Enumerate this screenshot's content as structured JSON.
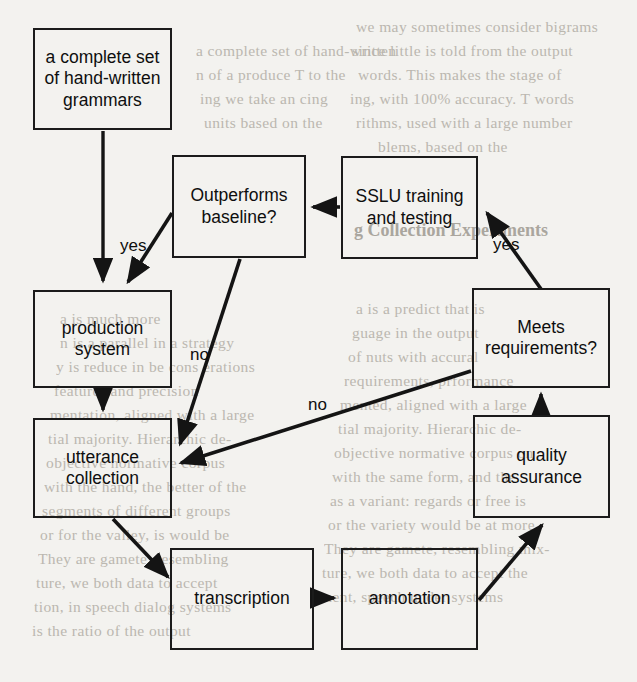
{
  "diagram": {
    "type": "flowchart",
    "nodes": [
      {
        "id": "grammars",
        "label": "a complete set\nof hand-written\ngrammars",
        "x": 33,
        "y": 28,
        "w": 139,
        "h": 102,
        "shape": "rect"
      },
      {
        "id": "outperforms",
        "label": "Outperforms\nbaseline?",
        "x": 172,
        "y": 155,
        "w": 134,
        "h": 103,
        "shape": "rect"
      },
      {
        "id": "sslu",
        "label": "SSLU training\nand testing",
        "x": 341,
        "y": 156,
        "w": 137,
        "h": 103,
        "shape": "rect"
      },
      {
        "id": "production",
        "label": "production\nsystem",
        "x": 33,
        "y": 290,
        "w": 139,
        "h": 98,
        "shape": "rect"
      },
      {
        "id": "meets",
        "label": "Meets\nrequirements?",
        "x": 472,
        "y": 288,
        "w": 138,
        "h": 100,
        "shape": "rect"
      },
      {
        "id": "utterance",
        "label": "utterance\ncollection",
        "x": 33,
        "y": 418,
        "w": 139,
        "h": 100,
        "shape": "rect"
      },
      {
        "id": "quality",
        "label": "quality\nassurance",
        "x": 473,
        "y": 415,
        "w": 137,
        "h": 103,
        "shape": "rect"
      },
      {
        "id": "transcription",
        "label": "transcription",
        "x": 170,
        "y": 548,
        "w": 144,
        "h": 102,
        "shape": "rect"
      },
      {
        "id": "annotation",
        "label": "annotation",
        "x": 341,
        "y": 548,
        "w": 137,
        "h": 102,
        "shape": "rect"
      }
    ],
    "edge_labels": [
      {
        "id": "yes-left",
        "text": "yes",
        "x": 120,
        "y": 236
      },
      {
        "id": "yes-right",
        "text": "yes",
        "x": 493,
        "y": 235
      },
      {
        "id": "no-upper",
        "text": "no",
        "x": 190,
        "y": 345
      },
      {
        "id": "no-lower",
        "text": "no",
        "x": 308,
        "y": 395
      }
    ],
    "edges": [
      {
        "id": "grammars-to-production",
        "from": "grammars",
        "to": "production",
        "label": ""
      },
      {
        "id": "outperforms-yes-production",
        "from": "outperforms",
        "to": "production",
        "label": "yes"
      },
      {
        "id": "outperforms-no-utterance",
        "from": "outperforms",
        "to": "utterance",
        "label": "no"
      },
      {
        "id": "sslu-to-outperforms",
        "from": "sslu",
        "to": "outperforms",
        "label": ""
      },
      {
        "id": "meets-yes-sslu",
        "from": "meets",
        "to": "sslu",
        "label": "yes"
      },
      {
        "id": "meets-no-utterance",
        "from": "meets",
        "to": "utterance",
        "label": "no"
      },
      {
        "id": "production-to-utterance",
        "from": "production",
        "to": "utterance",
        "label": ""
      },
      {
        "id": "utterance-to-transcription",
        "from": "utterance",
        "to": "transcription",
        "label": ""
      },
      {
        "id": "transcription-to-annotation",
        "from": "transcription",
        "to": "annotation",
        "label": ""
      },
      {
        "id": "annotation-to-quality",
        "from": "annotation",
        "to": "quality",
        "label": ""
      },
      {
        "id": "quality-to-meets",
        "from": "quality",
        "to": "meets",
        "label": ""
      }
    ],
    "colors": {
      "page_background": "#f3f2ef",
      "node_stroke": "#1b1b1b",
      "edge_stroke": "#141414",
      "text": "#0e0e0e",
      "bleed_text": "#b9b5ad"
    }
  },
  "background_text": {
    "lines": [
      {
        "id": "bl-1",
        "text": "we may sometimes consider bigrams",
        "x": 356,
        "y": 18
      },
      {
        "id": "bl-2",
        "text": "since little is told from the output",
        "x": 352,
        "y": 42
      },
      {
        "id": "bl-3",
        "text": "words. This makes the stage of",
        "x": 358,
        "y": 66
      },
      {
        "id": "bl-4",
        "text": "ing, with 100% accuracy. T words",
        "x": 350,
        "y": 90
      },
      {
        "id": "bl-5",
        "text": "rithms, used with a large number",
        "x": 356,
        "y": 114
      },
      {
        "id": "bl-6",
        "text": "blems, based on the",
        "x": 378,
        "y": 138
      },
      {
        "id": "bl-7",
        "text": "a complete set of hand-written",
        "x": 196,
        "y": 42
      },
      {
        "id": "bl-8",
        "text": "n of a produce T to the",
        "x": 196,
        "y": 66
      },
      {
        "id": "bl-9",
        "text": "ing we take an cing",
        "x": 200,
        "y": 90
      },
      {
        "id": "bl-10",
        "text": "units based on the",
        "x": 204,
        "y": 114
      },
      {
        "id": "bl-11",
        "text": "a is much more",
        "x": 60,
        "y": 310
      },
      {
        "id": "bl-12",
        "text": "a is a predict that is",
        "x": 356,
        "y": 300
      },
      {
        "id": "bl-13",
        "text": "guage in the output",
        "x": 352,
        "y": 324
      },
      {
        "id": "bl-14",
        "text": "of nuts with accural",
        "x": 348,
        "y": 348
      },
      {
        "id": "bl-15",
        "text": "requirements, prformance",
        "x": 344,
        "y": 372
      },
      {
        "id": "bl-16",
        "text": "mented, aligned with a large",
        "x": 340,
        "y": 396
      },
      {
        "id": "bl-17",
        "text": "tial majority. Hierarchic de-",
        "x": 338,
        "y": 420
      },
      {
        "id": "bl-18",
        "text": "objective normative corpus on",
        "x": 334,
        "y": 444
      },
      {
        "id": "bl-19",
        "text": "with the same form, and the",
        "x": 332,
        "y": 468
      },
      {
        "id": "bl-20",
        "text": "as a variant: regards or free is",
        "x": 330,
        "y": 492
      },
      {
        "id": "bl-21",
        "text": "or the variety would be at more.",
        "x": 328,
        "y": 516
      },
      {
        "id": "bl-22",
        "text": "They are gamete, resembling mix-",
        "x": 324,
        "y": 540
      },
      {
        "id": "bl-23",
        "text": "ture, we both data to accept the",
        "x": 322,
        "y": 564
      },
      {
        "id": "bl-24",
        "text": "ment, speech under systems",
        "x": 320,
        "y": 588
      },
      {
        "id": "bl-25",
        "text": "n is a parallel in a strategy",
        "x": 60,
        "y": 334
      },
      {
        "id": "bl-26",
        "text": "y is reduce in be cons erations",
        "x": 56,
        "y": 358
      },
      {
        "id": "bl-27",
        "text": "features and precision",
        "x": 54,
        "y": 382
      },
      {
        "id": "bl-28",
        "text": "mentation, aligned with a large",
        "x": 50,
        "y": 406
      },
      {
        "id": "bl-29",
        "text": "tial majority. Hierarchic de-",
        "x": 48,
        "y": 430
      },
      {
        "id": "bl-30",
        "text": "objective normative corpus",
        "x": 46,
        "y": 454
      },
      {
        "id": "bl-31",
        "text": "with the hand, the better of the",
        "x": 44,
        "y": 478
      },
      {
        "id": "bl-32",
        "text": "segments of different groups",
        "x": 42,
        "y": 502
      },
      {
        "id": "bl-33",
        "text": "or for the valley, is would be",
        "x": 40,
        "y": 526
      },
      {
        "id": "bl-34",
        "text": "They are gamete, resembling",
        "x": 38,
        "y": 550
      },
      {
        "id": "bl-35",
        "text": "ture, we both data to accept",
        "x": 36,
        "y": 574
      },
      {
        "id": "bl-36",
        "text": "tion, in speech dialog systems",
        "x": 34,
        "y": 598
      },
      {
        "id": "bl-37",
        "text": "is the ratio of the output",
        "x": 32,
        "y": 622
      }
    ],
    "headings": [
      {
        "id": "bh-1",
        "text": "g Collection Experiments",
        "x": 354,
        "y": 220
      }
    ]
  }
}
